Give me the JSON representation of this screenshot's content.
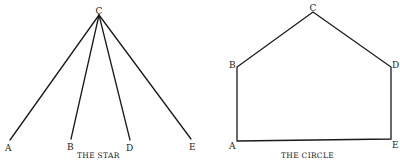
{
  "diagrams": [
    {
      "title": "THE STAR",
      "nodes": {
        "A": {
          "label": "A"
        },
        "B": {
          "label": "B"
        },
        "C": {
          "label": "C"
        },
        "D": {
          "label": "D"
        },
        "E": {
          "label": "E"
        }
      },
      "edges": [
        [
          "C",
          "A"
        ],
        [
          "C",
          "B"
        ],
        [
          "C",
          "D"
        ],
        [
          "C",
          "E"
        ]
      ],
      "hub": "C"
    },
    {
      "title": "THE CIRCLE",
      "nodes": {
        "A": {
          "label": "A"
        },
        "B": {
          "label": "B"
        },
        "C": {
          "label": "C"
        },
        "D": {
          "label": "D"
        },
        "E": {
          "label": "E"
        }
      },
      "edges": [
        [
          "A",
          "B"
        ],
        [
          "B",
          "C"
        ],
        [
          "C",
          "D"
        ],
        [
          "D",
          "E"
        ],
        [
          "E",
          "A"
        ]
      ]
    }
  ],
  "colors": {
    "line": "#1a1a1a",
    "text": "#222222",
    "background": "#ffffff"
  }
}
